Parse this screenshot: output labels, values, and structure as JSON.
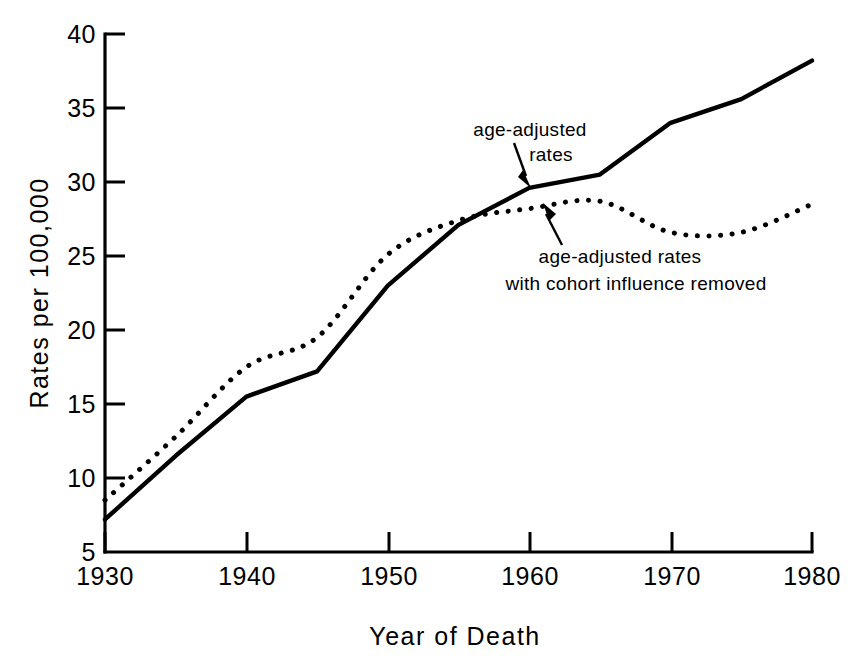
{
  "chart_data": {
    "type": "line",
    "title": "",
    "xlabel": "Year of Death",
    "ylabel": "Rates per 100,000",
    "xlim": [
      1930,
      1980
    ],
    "ylim": [
      5,
      40
    ],
    "xticks": [
      1930,
      1940,
      1950,
      1960,
      1970,
      1980
    ],
    "xtick_labels": [
      "1930",
      "1940",
      "1950",
      "1960",
      "1970",
      "1980"
    ],
    "yticks": [
      5,
      10,
      15,
      20,
      25,
      30,
      35,
      40
    ],
    "ytick_labels": [
      "5",
      "10",
      "15",
      "20",
      "25",
      "30",
      "35",
      "40"
    ],
    "grid": false,
    "legend_position": "inline-annotations",
    "x": [
      1930,
      1935,
      1940,
      1945,
      1950,
      1955,
      1960,
      1965,
      1970,
      1975,
      1980
    ],
    "series": [
      {
        "name": "age-adjusted rates",
        "style": "solid",
        "values": [
          7.2,
          11.5,
          15.5,
          17.2,
          23.0,
          27.1,
          29.6,
          30.5,
          34.0,
          35.6,
          38.2
        ]
      },
      {
        "name": "age-adjusted rates with cohort influence removed",
        "style": "dotted",
        "values": [
          8.5,
          12.8,
          17.5,
          19.5,
          25.1,
          27.4,
          28.2,
          28.7,
          26.6,
          26.6,
          28.5
        ]
      }
    ],
    "annotations": [
      {
        "id": "annotation-solid",
        "lines": [
          "age-adjusted",
          "rates"
        ],
        "points_to_year": 1959,
        "points_to_value": 29.4
      },
      {
        "id": "annotation-dotted",
        "lines": [
          "age-adjusted rates",
          "with cohort influence removed"
        ],
        "points_to_year": 1962,
        "points_to_value": 28.5
      }
    ]
  }
}
